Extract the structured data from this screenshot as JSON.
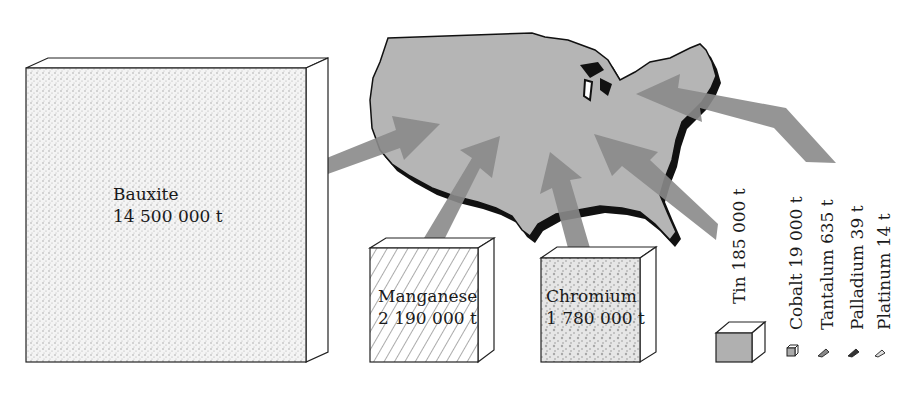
{
  "colors": {
    "map_fill": "#b5b5b5",
    "map_shadow": "#111111",
    "arrow": "#8a8a8a",
    "box_outline": "#222222",
    "tin_fill": "#b0b0b0"
  },
  "diagram": {
    "map": {
      "label": "United States"
    },
    "minerals": [
      {
        "name": "Bauxite",
        "amount": "14 500 000 t",
        "pattern": "stipple"
      },
      {
        "name": "Manganese",
        "amount": "2 190 000 t",
        "pattern": "hatch"
      },
      {
        "name": "Chromium",
        "amount": "1 780 000 t",
        "pattern": "mottled"
      },
      {
        "name": "Tin",
        "amount": "185 000 t",
        "pattern": "gray-cube"
      },
      {
        "name": "Cobalt",
        "amount": "19 000 t",
        "pattern": "small-cube"
      },
      {
        "name": "Tantalum",
        "amount": "635 t",
        "pattern": "tiny-prism"
      },
      {
        "name": "Palladium",
        "amount": "39 t",
        "pattern": "tiny-prism-dark"
      },
      {
        "name": "Platinum",
        "amount": "14 t",
        "pattern": "tiny-prism-light"
      }
    ],
    "labels": {
      "bauxite": "Bauxite",
      "bauxite_amt": "14 500 000 t",
      "manganese": "Manganese",
      "manganese_amt": "2 190 000 t",
      "chromium": "Chromium",
      "chromium_amt": "1 780 000 t",
      "tin": "Tin 185 000 t",
      "cobalt": "Cobalt 19 000 t",
      "tantalum": "Tantalum 635 t",
      "palladium": "Palladium 39 t",
      "platinum": "Platinum 14 t"
    }
  }
}
